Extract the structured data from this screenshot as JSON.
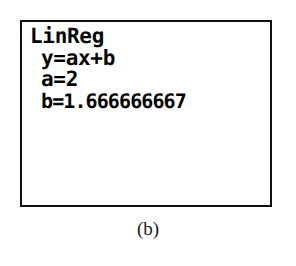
{
  "figure": {
    "caption": "(b)"
  },
  "calculator": {
    "device_type": "graphing-calculator-screen",
    "screen": {
      "background_color": "#ffffff",
      "text_color": "#050505",
      "border_color": "#111111",
      "lines": [
        {
          "text": "LinReg",
          "indented": false
        },
        {
          "text": "y=ax+b",
          "indented": true
        },
        {
          "text": "a=2",
          "indented": true
        },
        {
          "text": "b=1.666666667",
          "indented": true
        }
      ]
    },
    "regression": {
      "command": "LinReg",
      "model": "y=ax+b",
      "slope_label": "a",
      "slope_value": "2",
      "intercept_label": "b",
      "intercept_value": "1.666666667"
    }
  }
}
